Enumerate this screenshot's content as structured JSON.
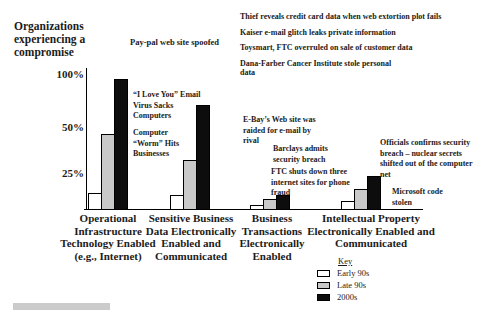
{
  "title_block": "Organizations\nexperiencing a\ncompromise",
  "chart_data": {
    "type": "bar",
    "title": "Organizations experiencing a compromise",
    "categories": [
      "Operational\nInfrastructure\nTechnology Enabled\n(e.g., Internet)",
      "Sensitive Business\nData Electronically\nEnabled and\nCommunicated",
      "Business\nTransactions\nElectronically\nEnabled",
      "Intellectual Property\nElectronically Enabled and\nCommunicated"
    ],
    "series": [
      {
        "name": "Early 90s",
        "color": "#ffffff",
        "values": [
          12,
          10,
          3,
          6
        ]
      },
      {
        "name": "Late 90s",
        "color": "#c9c9c9",
        "values": [
          47,
          33,
          7,
          15
        ]
      },
      {
        "name": "2000s",
        "color": "#0d0d0d",
        "values": [
          96,
          72,
          10,
          24
        ]
      }
    ],
    "y_tick_labels": [
      "100%",
      "50%",
      "25%"
    ],
    "y_scale_note": "non-linear axis: 25%, 50% and 100% labels roughly evenly spaced",
    "ylim": [
      0,
      100
    ],
    "legend": {
      "title": "Key",
      "position": "bottom-right"
    },
    "annotations": {
      "paypal": "Pay-pal web site spoofed",
      "news": [
        "Thief reveals credit card data when web extortion plot fails",
        "Kaiser e-mail glitch leaks private information",
        "Toysmart, FTC overruled on sale of customer data",
        "Dana-Farber Cancer Institute stole personal\ndata"
      ],
      "love_virus": "“I Love You” Email\nVirus Sacks\nComputers",
      "worm": "Computer\n“Worm” Hits\nBusinesses",
      "ebay": "E-Bay’s Web site was\nraided for e-mail by\nrival",
      "barclays": "Barclays admits\nsecurity breach",
      "ftc": "FTC shuts down three\ninternet sites for phone\nfraud",
      "officials": "Officials confirms security\nbreach – nuclear secrets\nshifted out of the computer\nnet",
      "microsoft": "Microsoft code\nstolen"
    }
  }
}
